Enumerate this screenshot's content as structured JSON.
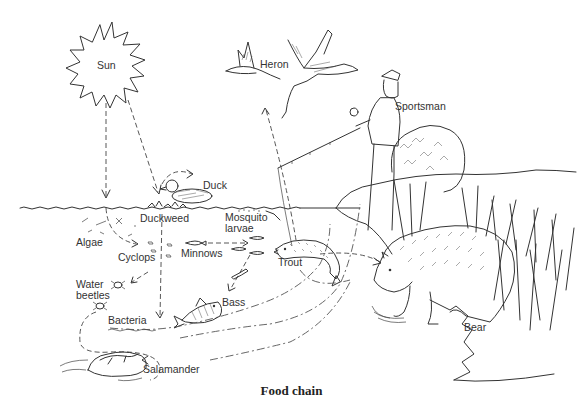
{
  "diagram": {
    "caption": "Food chain",
    "labels": {
      "sun": "Sun",
      "heron": "Heron",
      "sportsman": "Sportsman",
      "duck": "Duck",
      "duckweed": "Duckweed",
      "mosquito_larvae_line1": "Mosquito",
      "mosquito_larvae_line2": "larvae",
      "algae": "Algae",
      "cyclops": "Cyclops",
      "minnows": "Minnows",
      "trout": "Trout",
      "water_beetles_line1": "Water",
      "water_beetles_line2": "beetles",
      "bass": "Bass",
      "bacteria": "Bacteria",
      "salamander": "Salamander",
      "bear": "Bear"
    },
    "colors": {
      "ink": "#333333",
      "background": "#ffffff"
    }
  }
}
